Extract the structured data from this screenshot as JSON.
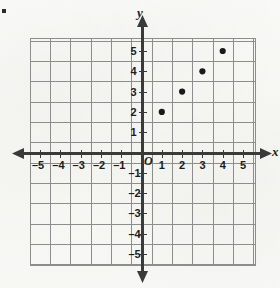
{
  "figure": {
    "kind": "coordinate-plane",
    "origin_label": "O",
    "x_axis_name": "x",
    "y_axis_name": "y",
    "marker_bullet": "▪"
  },
  "colors": {
    "background": "#f7f7f5",
    "grid": "#8d8d8d",
    "axis": "#3a3a3a",
    "point": "#1a1a1a",
    "text": "#1c1c1c"
  },
  "chart_data": {
    "type": "scatter",
    "title": "",
    "xlabel": "x",
    "ylabel": "y",
    "xlim": [
      -6.5,
      6.5
    ],
    "ylim": [
      -6.5,
      6.5
    ],
    "grid": true,
    "legend": "none",
    "x_ticks": [
      -5,
      -4,
      -3,
      -2,
      -1,
      1,
      2,
      3,
      4,
      5
    ],
    "y_ticks": [
      5,
      4,
      3,
      2,
      1,
      -1,
      -2,
      -3,
      -4,
      -5
    ],
    "x_tick_labels": [
      "–5",
      "–4",
      "–3",
      "–2",
      "–1",
      "1",
      "2",
      "3",
      "4",
      "5"
    ],
    "y_tick_labels": [
      "5",
      "4",
      "3",
      "2",
      "1",
      "–1",
      "–2",
      "–3",
      "–4",
      "–5"
    ],
    "points": [
      {
        "x": 1,
        "y": 2,
        "label": "(1, 2)"
      },
      {
        "x": 2,
        "y": 3,
        "label": "(2, 3)"
      },
      {
        "x": 3,
        "y": 4,
        "label": "(3, 4)"
      },
      {
        "x": 4,
        "y": 5,
        "label": "(4, 5)"
      }
    ]
  }
}
